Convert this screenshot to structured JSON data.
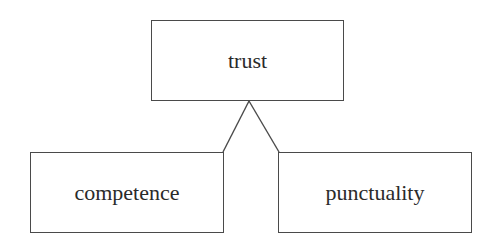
{
  "diagram": {
    "type": "tree",
    "root": {
      "id": "trust",
      "label": "trust"
    },
    "children": [
      {
        "id": "competence",
        "label": "competence"
      },
      {
        "id": "punctuality",
        "label": "punctuality"
      }
    ],
    "edges": [
      {
        "from": "trust",
        "to": "competence"
      },
      {
        "from": "trust",
        "to": "punctuality"
      }
    ],
    "colors": {
      "stroke": "#4a4a4a",
      "text": "#2a2a2a",
      "background": "#ffffff"
    }
  }
}
